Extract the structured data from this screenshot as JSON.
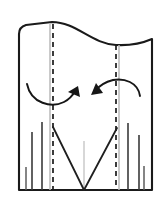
{
  "figure": {
    "type": "line-diagram",
    "canvas": {
      "width": 167,
      "height": 202
    },
    "background_color": "#ffffff",
    "ink_color": "#1a1a1a",
    "guide_color": "#b9b9b9"
  },
  "outline": {
    "name": "garment-body-outline",
    "description": "Rectangular panel with wavy (S-curve) top edge, rounded top-left corner, sharp top-right corner",
    "left_edge_x": 19,
    "right_edge_x": 152,
    "bottom_edge_y": 190,
    "top_left_y": 27,
    "top_right_y": 44,
    "stroke_width": 2.1,
    "path": "M 19 34 Q 19 27 26 25 L 52 22 C 76 22 92 44 116 45 C 134 46 145 42 152 39 L 152 190 L 19 190 Z"
  },
  "fold_lines": [
    {
      "name": "left-fold-line",
      "style": "dashed",
      "x": 53,
      "y_start": 24,
      "y_end": 190,
      "dash": "5 4"
    },
    {
      "name": "right-fold-line",
      "style": "dashed",
      "x": 116,
      "y_start": 45,
      "y_end": 190,
      "dash": "5 4"
    }
  ],
  "guide_lines": [
    {
      "name": "left-guide-line",
      "x": 50,
      "y_start": 23,
      "y_end": 190,
      "color": "#b9b9b9"
    },
    {
      "name": "right-guide-line",
      "x": 119,
      "y_start": 45,
      "y_end": 190,
      "color": "#b9b9b9"
    },
    {
      "name": "center-guide-line",
      "x": 84,
      "y_start": 141,
      "y_end": 190,
      "color": "#c6c6c6"
    }
  ],
  "dart": {
    "name": "center-dart",
    "description": "V-shaped dart converging at bottom center",
    "apex_x": 84,
    "apex_y": 190,
    "left_leg_top_x": 53,
    "left_leg_top_y": 127,
    "right_leg_top_x": 117,
    "right_leg_top_y": 128
  },
  "ticks": [
    {
      "name": "tick-1",
      "x": 32,
      "y_top": 132,
      "y_bottom": 190,
      "weight": "dark"
    },
    {
      "name": "tick-2",
      "x": 42,
      "y_top": 122,
      "y_bottom": 190,
      "weight": "dark"
    },
    {
      "name": "tick-3",
      "x": 26,
      "y_top": 167,
      "y_bottom": 190,
      "weight": "mid"
    },
    {
      "name": "tick-4",
      "x": 128,
      "y_top": 123,
      "y_bottom": 190,
      "weight": "dark"
    },
    {
      "name": "tick-5",
      "x": 139,
      "y_top": 135,
      "y_bottom": 190,
      "weight": "dark"
    },
    {
      "name": "tick-6",
      "x": 144,
      "y_top": 166,
      "y_bottom": 190,
      "weight": "mid"
    }
  ],
  "arrows": [
    {
      "name": "left-rotation-arrow",
      "direction": "counter-clockwise-up-right",
      "description": "Curve dipping down then sweeping up, arrowhead pointing upper-right",
      "curve": "M 27 84 C 31 104 52 108 64 102 C 70 99 73 95 76 90",
      "head_points": "76 88 69 95 79 96",
      "head_rotation": -42
    },
    {
      "name": "right-rotation-arrow",
      "direction": "clockwise-down-left",
      "description": "Arc rising over the right fold line, arrowhead pointing lower-left",
      "curve": "M 140 96 C 138 82 124 78 113 80 C 105 82 99 86 95 91",
      "head_points": "93 93 103 92 97 84",
      "head_rotation": 40
    }
  ]
}
